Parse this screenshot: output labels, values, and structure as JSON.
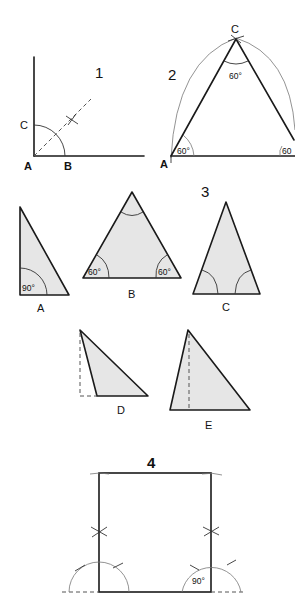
{
  "figures": {
    "fig1": {
      "number": "1",
      "labels": {
        "A": "A",
        "B": "B",
        "C": "C"
      },
      "description": "Bisecting a right angle"
    },
    "fig2": {
      "number": "2",
      "labels": {
        "A": "A",
        "C": "C"
      },
      "angles": {
        "top": "60°",
        "left": "60°",
        "right": "60"
      },
      "description": "Constructing an equilateral triangle"
    },
    "fig3": {
      "number": "3",
      "triangles": [
        {
          "label": "A",
          "angle": "90°"
        },
        {
          "label": "B",
          "angle_left": "60°",
          "angle_right": "60°"
        },
        {
          "label": "C"
        },
        {
          "label": "D"
        },
        {
          "label": "E"
        }
      ]
    },
    "fig4": {
      "number": "4",
      "angle": "90°",
      "description": "Constructing a square"
    }
  },
  "colors": {
    "line": "#1a1a1a",
    "fill": "#e6e6e6",
    "background": "#ffffff"
  }
}
